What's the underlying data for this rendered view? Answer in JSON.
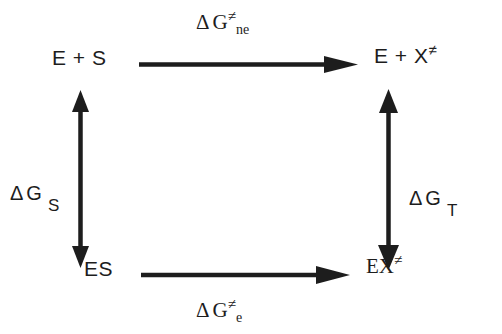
{
  "diagram": {
    "type": "thermodynamic-cycle",
    "background_color": "#ffffff",
    "ink_color": "#1d1d1d",
    "nodes": {
      "top_left": {
        "id": "E+S",
        "base": "E + S",
        "superscript": ""
      },
      "top_right": {
        "id": "E+X",
        "base": "E + X",
        "superscript": "≠"
      },
      "bottom_left": {
        "id": "ES",
        "base": "ES",
        "superscript": ""
      },
      "bottom_right": {
        "id": "EX",
        "base": "EX",
        "superscript": "≠"
      }
    },
    "edges": {
      "top": {
        "from": "E + S",
        "to": "E + X≠",
        "direction": "right",
        "heads": 1,
        "label": {
          "delta": "Δ",
          "g": "G",
          "superscript": "≠",
          "subscript": "ne"
        }
      },
      "bottom": {
        "from": "ES",
        "to": "EX≠",
        "direction": "right",
        "heads": 1,
        "label": {
          "delta": "Δ",
          "g": "G",
          "superscript": "≠",
          "subscript": "e"
        }
      },
      "left": {
        "from": "E + S",
        "to": "ES",
        "direction": "both",
        "heads": 2,
        "label": {
          "delta": "Δ",
          "g": "G",
          "superscript": "",
          "subscript": "S"
        }
      },
      "right": {
        "from": "E + X≠",
        "to": "EX≠",
        "direction": "both",
        "heads": 2,
        "label": {
          "delta": "Δ",
          "g": "G",
          "superscript": "",
          "subscript": "T"
        }
      }
    }
  }
}
